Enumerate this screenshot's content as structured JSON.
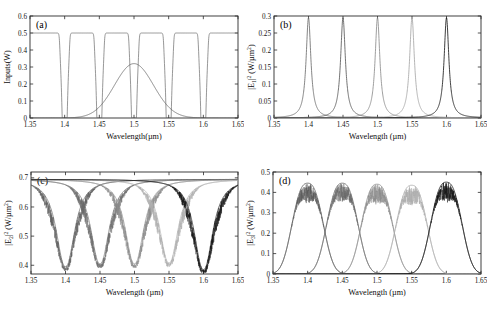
{
  "figure": {
    "name": "four-panel-spectral-response",
    "background": "#ffffff",
    "panels": [
      "a",
      "b",
      "c",
      "d"
    ]
  },
  "axis_common": {
    "xlabel_compact": "Wavelength(µm)",
    "xlabel_spaced": "Wavelength (µm)",
    "xticks": [
      "1.35",
      "1.4",
      "1.45",
      "1.5",
      "1.55",
      "1.6",
      "1.65"
    ],
    "xlim": [
      1.35,
      1.65
    ],
    "resonances": [
      1.4,
      1.45,
      1.5,
      1.55,
      1.6
    ],
    "series_colors": [
      "#6f6f6f",
      "#5a5a5a",
      "#8c8c8c",
      "#a8a8a8",
      "#1c1c1c"
    ]
  },
  "chart_data": [
    {
      "type": "line",
      "panel": "a",
      "tag": "(a)",
      "title": "",
      "xlabel": "Wavelength(µm)",
      "ylabel": "Inputs(W)",
      "xlim": [
        1.35,
        1.65
      ],
      "ylim": [
        0,
        0.6
      ],
      "xticks": [
        "1.35",
        "1.4",
        "1.45",
        "1.5",
        "1.55",
        "1.6",
        "1.65"
      ],
      "yticks": [
        "0",
        "0.1",
        "0.2",
        "0.3",
        "0.4",
        "0.5",
        "0.6"
      ],
      "grid": false,
      "legend": "none",
      "description": "Flat 0.5 W input line with five narrow notch dips to 0 at the resonant wavelengths, plus one broad Gaussian pump peaking at 0.32 W near 1.5 um.",
      "series": [
        {
          "name": "notched-input-level",
          "color": "#6a6a6a",
          "baseline": 0.5,
          "notch_centers": [
            1.4,
            1.45,
            1.5,
            1.55,
            1.6
          ],
          "notch_depth": 0.0,
          "notch_halfwidth": 0.0055,
          "values_at_ticks": [
            0.5,
            0.0,
            0.0,
            0.0,
            0.0,
            0.0,
            0.5
          ]
        },
        {
          "name": "broad-gaussian-pump",
          "color": "#555555",
          "center": 1.5,
          "peak": 0.32,
          "sigma": 0.028,
          "values_at_ticks": [
            0.0,
            0.005,
            0.085,
            0.32,
            0.085,
            0.005,
            0.0
          ]
        }
      ]
    },
    {
      "type": "line",
      "panel": "b",
      "tag": "(b)",
      "title": "",
      "xlabel": "Wavelength (µm)",
      "ylabel": "|E1|^2 (W/µm^2)",
      "ylabel_parts": {
        "pre": "|E",
        "sub": "1",
        "sup": "2",
        "post": " (W/µm",
        "post_sup": "2",
        "tail": ")"
      },
      "xlim": [
        1.35,
        1.65
      ],
      "ylim": [
        0,
        0.3
      ],
      "xticks": [
        "1.35",
        "1.4",
        "1.45",
        "1.5",
        "1.55",
        "1.6",
        "1.65"
      ],
      "yticks": [
        "0",
        "0.05",
        "0.1",
        "0.15",
        "0.2",
        "0.25",
        "0.3"
      ],
      "grid": false,
      "legend": "none",
      "description": "Five sharp Lorentzian resonance peaks each reaching about 0.295 W/um^2, centred at 1.40, 1.45, 1.50, 1.55 and 1.60 um, with near-zero baseline between them.",
      "series": [
        {
          "name": "mode-1400nm",
          "color": "#6f6f6f",
          "center": 1.4,
          "peak": 0.295,
          "hwhm": 0.0042
        },
        {
          "name": "mode-1450nm",
          "color": "#5a5a5a",
          "center": 1.45,
          "peak": 0.295,
          "hwhm": 0.0042
        },
        {
          "name": "mode-1500nm",
          "color": "#8c8c8c",
          "center": 1.5,
          "peak": 0.295,
          "hwhm": 0.0042
        },
        {
          "name": "mode-1550nm",
          "color": "#a8a8a8",
          "center": 1.55,
          "peak": 0.295,
          "hwhm": 0.0042
        },
        {
          "name": "mode-1600nm",
          "color": "#1c1c1c",
          "center": 1.6,
          "peak": 0.295,
          "hwhm": 0.0042
        }
      ]
    },
    {
      "type": "line",
      "panel": "c",
      "tag": "(c)",
      "title": "",
      "xlabel": "Wavelength (µm)",
      "ylabel": "|E2|^2 (W/µm^2)",
      "ylabel_parts": {
        "pre": "|E",
        "sub": "2",
        "sup": "2",
        "post": " (W/µm",
        "post_sup": "2",
        "tail": ")"
      },
      "xlim": [
        1.35,
        1.65
      ],
      "ylim": [
        0.37,
        0.72
      ],
      "xticks": [
        "1.35",
        "1.4",
        "1.45",
        "1.5",
        "1.55",
        "1.6",
        "1.65"
      ],
      "yticks": [
        "0.4",
        "0.5",
        "0.6",
        "0.7"
      ],
      "grid": false,
      "legend": "none",
      "noise": {
        "present": true,
        "region": "dip-shoulders",
        "amplitude": 0.055
      },
      "description": "Five deep noisy dips descending from a 0.695 plateau down to roughly 0.39 at each resonant wavelength; shoulders are filled with dense high-frequency oscillation.",
      "series": [
        {
          "name": "dip-1400nm",
          "color": "#5e5e5e",
          "center": 1.4,
          "plateau": 0.695,
          "minimum": 0.395,
          "halfwidth": 0.026
        },
        {
          "name": "dip-1450nm",
          "color": "#6b6b6b",
          "center": 1.45,
          "plateau": 0.695,
          "minimum": 0.405,
          "halfwidth": 0.026
        },
        {
          "name": "dip-1500nm",
          "color": "#8a8a8a",
          "center": 1.5,
          "plateau": 0.695,
          "minimum": 0.405,
          "halfwidth": 0.026
        },
        {
          "name": "dip-1550nm",
          "color": "#aeaeae",
          "center": 1.55,
          "plateau": 0.695,
          "minimum": 0.408,
          "halfwidth": 0.026
        },
        {
          "name": "dip-1600nm",
          "color": "#141414",
          "center": 1.6,
          "plateau": 0.695,
          "minimum": 0.385,
          "halfwidth": 0.026
        }
      ]
    },
    {
      "type": "line",
      "panel": "d",
      "tag": "(d)",
      "title": "",
      "xlabel": "Wavelength (µm)",
      "ylabel": "|E3|^2 (W/µm^2)",
      "ylabel_parts": {
        "pre": "|E",
        "sub": "3",
        "sup": "2",
        "post": " (W/µm",
        "post_sup": "2",
        "tail": ")"
      },
      "xlim": [
        1.35,
        1.65
      ],
      "ylim": [
        0,
        0.5
      ],
      "xticks": [
        "1.35",
        "1.4",
        "1.45",
        "1.5",
        "1.55",
        "1.6",
        "1.65"
      ],
      "yticks": [
        "0",
        "0.1",
        "0.2",
        "0.3",
        "0.4",
        "0.5"
      ],
      "grid": false,
      "legend": "none",
      "noise": {
        "present": true,
        "region": "peak-tops",
        "amplitude": 0.1
      },
      "description": "Five broad flat-topped bands peaking near 0.44 W/um^2 at 1.40, 1.45, 1.50, 1.55 and 1.60 um, each crest broken by dense noisy oscillation between 0.32 and 0.45.",
      "series": [
        {
          "name": "band-1400nm",
          "color": "#585858",
          "center": 1.4,
          "peak": 0.445,
          "halfwidth": 0.027
        },
        {
          "name": "band-1450nm",
          "color": "#676767",
          "center": 1.45,
          "peak": 0.445,
          "halfwidth": 0.027
        },
        {
          "name": "band-1500nm",
          "color": "#8a8a8a",
          "center": 1.5,
          "peak": 0.44,
          "halfwidth": 0.027
        },
        {
          "name": "band-1550nm",
          "color": "#ababab",
          "center": 1.55,
          "peak": 0.435,
          "halfwidth": 0.027
        },
        {
          "name": "band-1600nm",
          "color": "#111111",
          "center": 1.6,
          "peak": 0.45,
          "halfwidth": 0.027
        }
      ]
    }
  ]
}
